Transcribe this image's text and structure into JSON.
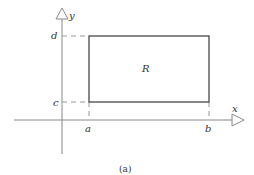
{
  "figure": {
    "caption": "(a)",
    "region_label": "R",
    "axes": {
      "x_label": "x",
      "y_label": "y"
    },
    "ticks": {
      "x": [
        "a",
        "b"
      ],
      "y": [
        "c",
        "d"
      ]
    },
    "colors": {
      "axis": "#888888",
      "rectangle": "#555555",
      "dashed": "#999999",
      "text": "#333333"
    }
  }
}
